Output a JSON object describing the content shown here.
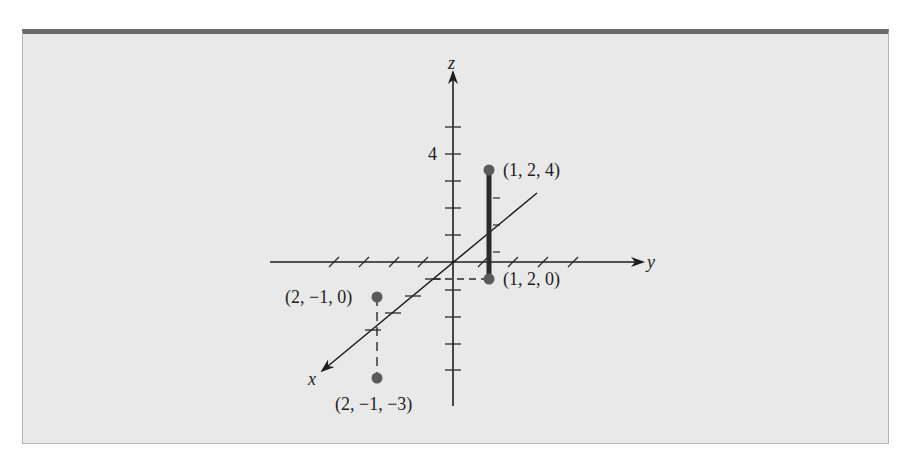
{
  "figure": {
    "axes": {
      "x_label": "x",
      "y_label": "y",
      "z_label": "z",
      "z_tick_label": "4"
    },
    "points": [
      {
        "label": "(1, 2, 4)",
        "coords": [
          1,
          2,
          4
        ]
      },
      {
        "label": "(1, 2, 0)",
        "coords": [
          1,
          2,
          0
        ]
      },
      {
        "label": "(2, −1, 0)",
        "coords": [
          2,
          -1,
          0
        ]
      },
      {
        "label": "(2, −1, −3)",
        "coords": [
          2,
          -1,
          -3
        ]
      }
    ],
    "segments": [
      {
        "from": "(1, 2, 0)",
        "to": "(1, 2, 4)",
        "style": "thick-solid"
      },
      {
        "from": "(2, −1, 0)",
        "to": "(2, −1, −3)",
        "style": "dashed"
      }
    ],
    "colors": {
      "background": "#e9e9e9",
      "frame_top": "#6a6a6a",
      "axis": "#1e1e1e",
      "point": "#5a5a5a"
    }
  }
}
